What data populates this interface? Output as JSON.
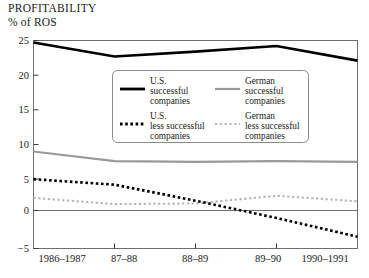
{
  "chart_data": {
    "type": "line",
    "title": "PROFITABILITY",
    "subtitle": "% of ROS",
    "xlabel": "",
    "ylabel": "% of ROS",
    "categories": [
      "1986–1987",
      "87–88",
      "88–89",
      "89–90",
      "1990–1991"
    ],
    "x_tick_labels": [
      "1986–1987",
      "87–88",
      "88–89",
      "89–90",
      "1990–1991"
    ],
    "y_tick_labels": [
      "25",
      "20",
      "15",
      "10",
      "5",
      "0",
      "−5"
    ],
    "y_ticks": [
      25,
      20,
      15,
      10,
      5,
      0,
      -5
    ],
    "ylim": [
      -5,
      25
    ],
    "grid": false,
    "legend_position": "upper-center",
    "series": [
      {
        "name": "U.S. successful companies",
        "legend_label_lines": [
          "U.S.",
          "successful",
          "companies"
        ],
        "style": "solid",
        "color": "#000000",
        "values": [
          24.7,
          22.7,
          23.4,
          24.2,
          22.1
        ]
      },
      {
        "name": "German successful companies",
        "legend_label_lines": [
          "German",
          "successful",
          "companies"
        ],
        "style": "solid",
        "color": "#9a9a9a",
        "values": [
          9.0,
          7.6,
          7.5,
          7.6,
          7.5
        ]
      },
      {
        "name": "U.S. less successful companies",
        "legend_label_lines": [
          "U.S.",
          "less successful",
          "companies"
        ],
        "style": "dotted",
        "color": "#000000",
        "values": [
          5.0,
          4.2,
          1.9,
          -0.6,
          -3.3
        ]
      },
      {
        "name": "German less successful companies",
        "legend_label_lines": [
          "German",
          "less successful",
          "companies"
        ],
        "style": "dotted",
        "color": "#b5b5b5",
        "values": [
          2.3,
          1.4,
          1.5,
          2.6,
          1.8
        ]
      }
    ]
  },
  "legend": {
    "us_successful": "U.S.\nsuccessful\ncompanies",
    "german_successful": "German\nsuccessful\ncompanies",
    "us_less_successful": "U.S.\nless successful\ncompanies",
    "german_less_successful": "German\nless successful\ncompanies",
    "us_l1": "U.S.",
    "us_l2": "successful",
    "us_l3": "companies",
    "de_l1": "German",
    "de_l2": "successful",
    "de_l3": "companies",
    "usl_l1": "U.S.",
    "usl_l2": "less successful",
    "usl_l3": "companies",
    "del_l1": "German",
    "del_l2": "less successful",
    "del_l3": "companies"
  },
  "axis": {
    "y0": "25",
    "y1": "20",
    "y2": "15",
    "y3": "10",
    "y4": "5",
    "y5": "0",
    "y6": "−5",
    "x0": "1986–1987",
    "x1": "87–88",
    "x2": "88–89",
    "x3": "89–90",
    "x4": "1990–1991"
  },
  "header": {
    "title": "PROFITABILITY",
    "subtitle": "% of ROS"
  }
}
